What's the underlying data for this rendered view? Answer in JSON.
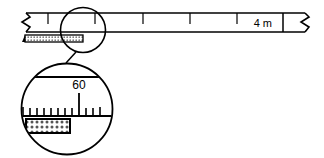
{
  "diagram": {
    "ink_color": "#000000",
    "background_color": "#ffffff",
    "hatch_fill_color": "#b3b3b3",
    "ruler": {
      "name": "measuring-scale",
      "length_label": "4 m",
      "left_end": "break-symbol",
      "right_end": "break-symbol",
      "tick_count": 6,
      "tick_positions_px": [
        48,
        95,
        143,
        190,
        237,
        283
      ]
    },
    "specimen_bar": {
      "name": "hatched-specimen-bar",
      "fill": "stipple"
    },
    "callout": {
      "source_circle": {
        "cx": 83,
        "cy": 30,
        "r": 23
      },
      "detail_circle": {
        "cx": 67,
        "cy": 109,
        "r": 46
      },
      "detail_reading": "60",
      "detail_minor_tick_count": 11
    }
  }
}
